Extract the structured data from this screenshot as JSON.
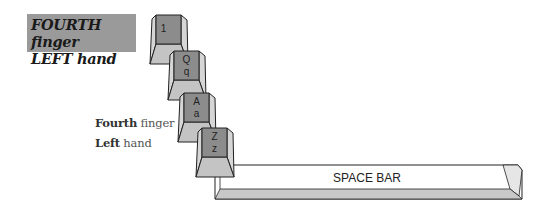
{
  "title": {
    "line1_bold": "FOURTH",
    "line1_rest": "finger",
    "line2_bold": "LEFT",
    "line2_rest": "hand"
  },
  "caption": {
    "line1_bold": "Fourth",
    "line1_rest": " finger",
    "line2_bold": "Left",
    "line2_rest": " hand"
  },
  "keys": [
    {
      "id": "key-1",
      "upper": "1",
      "lower": ""
    },
    {
      "id": "key-q",
      "upper": "Q",
      "lower": "q"
    },
    {
      "id": "key-a",
      "upper": "A",
      "lower": "a"
    },
    {
      "id": "key-z",
      "upper": "Z",
      "lower": "z"
    }
  ],
  "space_bar": {
    "label": "SPACE BAR"
  },
  "colors": {
    "title_bg": "#9a9a9a",
    "key_top": "#8c8c8c",
    "key_side": "#d6d6d6",
    "key_front": "#c4c4c4",
    "outline": "#222222"
  }
}
